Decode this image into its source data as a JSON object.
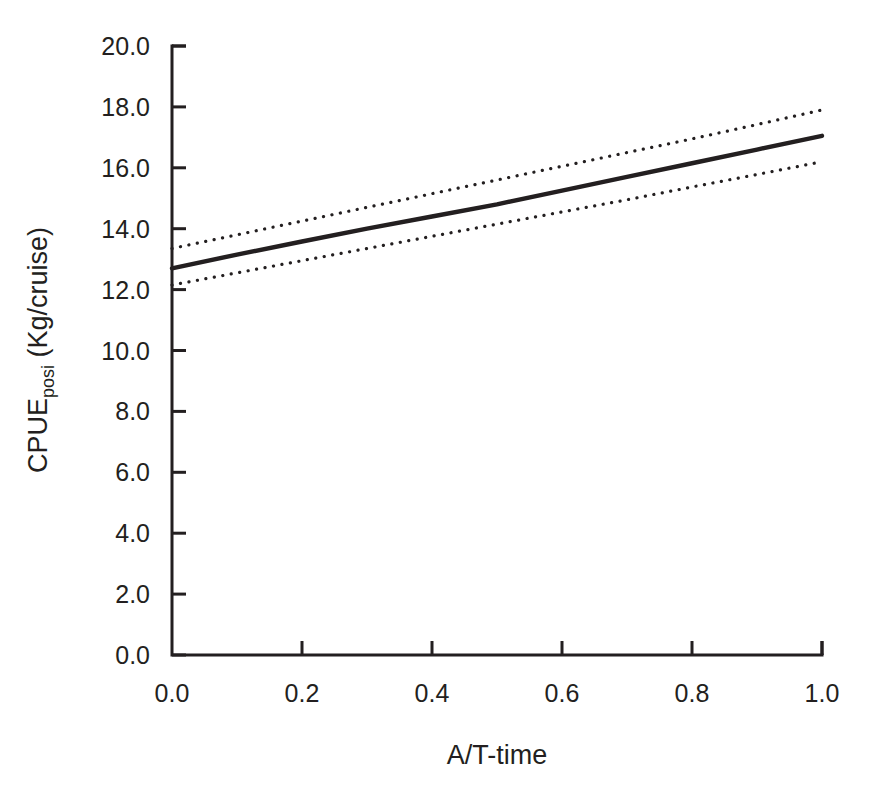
{
  "chart_data": {
    "type": "line",
    "title": "",
    "subtitle": "",
    "xlabel": "A/T-time",
    "ylabel_main": "CPUE",
    "ylabel_sub": "posi",
    "ylabel_tail": " (Kg/cruise)",
    "ylabel_full": "CPUE_posi (Kg/cruise)",
    "xlim": [
      0.0,
      1.0
    ],
    "ylim": [
      0.0,
      20.0
    ],
    "grid": false,
    "legend": "none",
    "x_ticks": [
      0.0,
      0.2,
      0.4,
      0.6,
      0.8,
      1.0
    ],
    "x_tick_labels": [
      "0.0",
      "0.2",
      "0.4",
      "0.6",
      "0.8",
      "1.0"
    ],
    "y_ticks": [
      0.0,
      2.0,
      4.0,
      6.0,
      8.0,
      10.0,
      12.0,
      14.0,
      16.0,
      18.0,
      20.0
    ],
    "y_tick_labels": [
      "0.0",
      "2.0",
      "4.0",
      "6.0",
      "8.0",
      "10.0",
      "12.0",
      "14.0",
      "16.0",
      "18.0",
      "20.0"
    ],
    "x": [
      0.0,
      0.1,
      0.2,
      0.3,
      0.4,
      0.5,
      0.6,
      0.7,
      0.8,
      0.9,
      1.0
    ],
    "series": [
      {
        "name": "fitted CPUE",
        "style": "solid",
        "color": "#231f20",
        "values": [
          12.7,
          13.15,
          13.58,
          14.0,
          14.4,
          14.8,
          15.25,
          15.7,
          16.15,
          16.6,
          17.05
        ]
      },
      {
        "name": "upper confidence limit",
        "style": "dotted",
        "color": "#231f20",
        "values": [
          13.35,
          13.8,
          14.25,
          14.7,
          15.15,
          15.6,
          16.05,
          16.5,
          16.95,
          17.42,
          17.9
        ]
      },
      {
        "name": "lower confidence limit",
        "style": "dotted",
        "color": "#231f20",
        "values": [
          12.15,
          12.55,
          12.95,
          13.35,
          13.75,
          14.15,
          14.55,
          14.95,
          15.37,
          15.78,
          16.2
        ]
      }
    ],
    "annotations": []
  },
  "colors": {
    "background": "#ffffff",
    "foreground": "#231f20"
  }
}
